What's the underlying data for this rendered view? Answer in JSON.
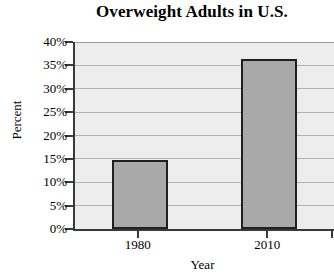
{
  "chart_data": {
    "type": "bar",
    "title": "Overweight Adults in U.S.",
    "xlabel": "Year",
    "ylabel": "Percent",
    "categories": [
      "1980",
      "2010"
    ],
    "values": [
      14.8,
      36.4
    ],
    "value_labels": [
      "14.8%",
      "36.4%"
    ],
    "ylim": [
      0,
      40
    ],
    "ytick_values": [
      0,
      5,
      10,
      15,
      20,
      25,
      30,
      35,
      40
    ],
    "ytick_labels": [
      "0%",
      "5%",
      "10%",
      "15%",
      "20%",
      "25%",
      "30%",
      "35%",
      "40%"
    ],
    "grid": true,
    "legend": false,
    "legend_position": "none",
    "series": [
      {
        "name": "Overweight adults",
        "values": [
          14.8,
          36.4
        ]
      }
    ],
    "colors": {
      "bar_fill": "#a9a9a9",
      "bar_border": "#202020",
      "plot_background": "#ededed",
      "gridline": "#b4b4b4",
      "axis": "#3a3a3a",
      "text": "#000000",
      "page_background": "#ffffff"
    }
  }
}
